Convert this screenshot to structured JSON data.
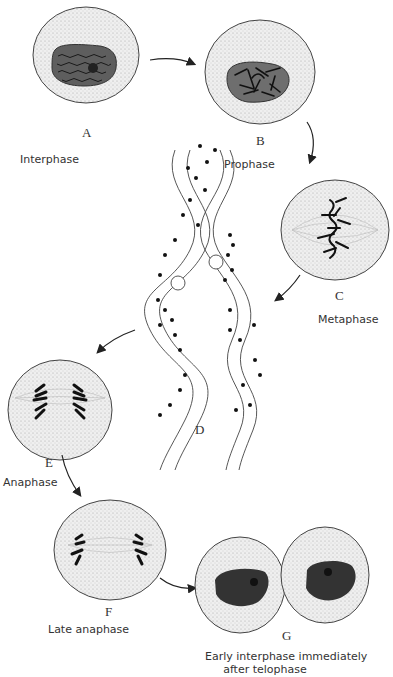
{
  "diagram": {
    "stages": [
      {
        "letter": "A",
        "caption": "Interphase"
      },
      {
        "letter": "B",
        "caption": "Prophase"
      },
      {
        "letter": "C",
        "caption": "Metaphase"
      },
      {
        "letter": "D",
        "caption": ""
      },
      {
        "letter": "E",
        "caption": "Anaphase"
      },
      {
        "letter": "F",
        "caption": "Late anaphase"
      },
      {
        "letter": "G",
        "caption": "Early interphase immediately after telophase"
      }
    ],
    "g_caption_line1": "Early interphase immediately",
    "g_caption_line2": "after telophase",
    "colors": {
      "cytoplasm": "#ebebeb",
      "nucleus": "#6e6e6e",
      "nucleus_dark": "#2a2a2a",
      "chromatin": "#111111",
      "outline": "#444444",
      "helix_band": "#d9d9d9"
    }
  }
}
